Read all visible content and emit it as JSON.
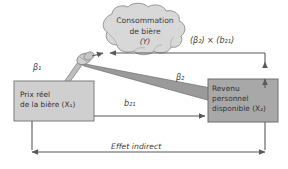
{
  "figure": {
    "type": "path-diagram",
    "language": "fr",
    "background": "#ffffff"
  },
  "cloud": {
    "name": "consommation-de-biere",
    "line1": "Consommation",
    "line2": "de bière",
    "line3_var": "Y",
    "line3": "(Y)",
    "fill": "#d8d8d8",
    "stroke": "#8f8f8f"
  },
  "boxes": [
    {
      "id": "prix-reel",
      "line1": "Prix réel",
      "line2": "de la bière",
      "var": "X",
      "var_sub": "1",
      "line2_full": "de la bière (X₁)",
      "fill": "#cfcfcf",
      "stroke": "#7d7d7d"
    },
    {
      "id": "revenu-personnel",
      "line1": "Revenu",
      "line2": "personnel",
      "line3": "disponible",
      "var": "X",
      "var_sub": "2",
      "line3_full": "disponible (X₂)",
      "fill": "#a8a8a8",
      "stroke": "#6e6e6e"
    }
  ],
  "labels": {
    "beta1": {
      "base": "β",
      "sub": "1",
      "text": "β₁"
    },
    "beta2": {
      "base": "β",
      "sub": "2",
      "text": "β₂"
    },
    "b21": {
      "base": "b",
      "sub": "21",
      "text": "b₂₁"
    },
    "product": {
      "open1": "(",
      "beta": "β",
      "beta_sub": "2",
      "close1": ")",
      "times": "×",
      "open2": "(",
      "b": "b",
      "b_sub": "21",
      "close2": ")",
      "text": "(β₂) × (b₂₁)"
    },
    "effet_indirect": "Effet indirect"
  },
  "colors": {
    "line": "#595959",
    "wedge": "#9a9a9a",
    "wedge_stroke": "#6f6f6f",
    "text": "#3a3a3a"
  }
}
